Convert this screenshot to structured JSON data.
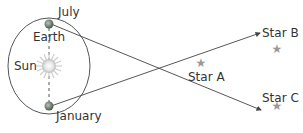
{
  "diagram": {
    "labels": {
      "july": "July",
      "earth": "Earth",
      "sun": "Sun",
      "january": "January",
      "star_a": "Star A",
      "star_b": "Star B",
      "star_c": "Star C"
    },
    "colors": {
      "orbit": "#555555",
      "lines": "#444444",
      "star": "#999999",
      "sun": "#d8d8d8",
      "earth": "#6a7a6a"
    }
  }
}
